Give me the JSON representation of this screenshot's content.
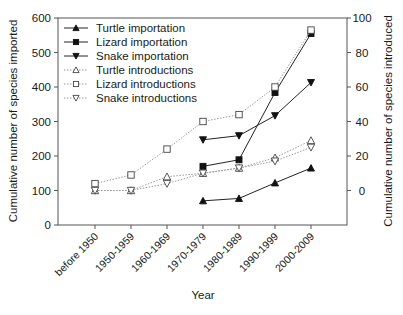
{
  "chart_data": {
    "type": "line",
    "title": "",
    "xlabel": "Year",
    "ylabel_left": "Cumulative number of species imported",
    "ylabel_right": "Cumulative number of species introduced",
    "categories": [
      "before 1950",
      "1950-1959",
      "1960-1969",
      "1970-1979",
      "1980-1989",
      "1990-1999",
      "2000-2009"
    ],
    "ylim_left": [
      0,
      600
    ],
    "yticks_left": [
      0,
      100,
      200,
      300,
      400,
      500,
      600
    ],
    "ylim_right": [
      -20,
      100
    ],
    "yticks_right": [
      0,
      20,
      40,
      60,
      80,
      100
    ],
    "grid": false,
    "legend_position": "upper left",
    "series": [
      {
        "name": "Turtle importation",
        "axis": "left",
        "marker": "triangle-up",
        "filled": true,
        "line": "solid",
        "values": [
          null,
          null,
          null,
          70,
          77,
          122,
          165
        ]
      },
      {
        "name": "Lizard importation",
        "axis": "left",
        "marker": "square",
        "filled": true,
        "line": "solid",
        "values": [
          null,
          null,
          null,
          170,
          189,
          384,
          555
        ]
      },
      {
        "name": "Snake importation",
        "axis": "left",
        "marker": "triangle-down",
        "filled": true,
        "line": "solid",
        "values": [
          null,
          null,
          null,
          247,
          259,
          317,
          413
        ]
      },
      {
        "name": "Turtle introductions",
        "axis": "right",
        "marker": "triangle-up",
        "filled": false,
        "line": "dotted",
        "values": [
          0,
          0,
          8,
          10,
          13,
          19,
          29
        ]
      },
      {
        "name": "Lizard introductions",
        "axis": "right",
        "marker": "square",
        "filled": false,
        "line": "dotted",
        "values": [
          4,
          9,
          24,
          40,
          44,
          60,
          93
        ]
      },
      {
        "name": "Snake introductions",
        "axis": "right",
        "marker": "triangle-down",
        "filled": false,
        "line": "dotted",
        "values": [
          0,
          0,
          4,
          10,
          13,
          17,
          25
        ]
      }
    ]
  },
  "colors": {
    "axis": "#555555",
    "solid_line": "#222222",
    "dotted_line": "#9a9a9a",
    "marker_fill": "#111111"
  }
}
